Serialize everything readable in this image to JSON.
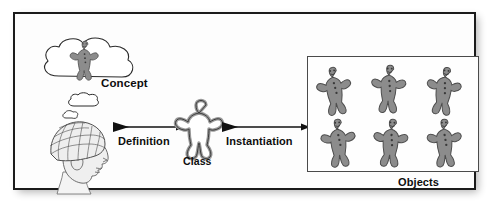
{
  "figure": {
    "frame": {
      "border_color": "#1b1b1b",
      "background": "#fdfdfd"
    }
  },
  "labels": {
    "concept": "Concept",
    "definition": "Definition",
    "class": "Class",
    "instantiation": "Instantiation",
    "objects": "Objects"
  },
  "elements": {
    "thought_cloud": "thought-cloud",
    "concept_figure": "gingerbread-man",
    "head": "human-head-phrenology",
    "class_shape": "cookie-cutter-outline",
    "arrow_definition": "right-arrow",
    "arrow_instantiation": "right-arrow"
  },
  "objects_box": {
    "count": 6,
    "rows": 2,
    "columns": 3,
    "items": [
      {
        "name": "gingerbread-man-1"
      },
      {
        "name": "gingerbread-man-2"
      },
      {
        "name": "gingerbread-man-3"
      },
      {
        "name": "gingerbread-man-4"
      },
      {
        "name": "gingerbread-man-5"
      },
      {
        "name": "gingerbread-man-6"
      }
    ]
  },
  "colors": {
    "cookie_fill": "#8c8c8c",
    "cookie_stroke": "#4d4d4d",
    "outline": "#2b2b2b",
    "text": "#0d0d0d",
    "box_border": "#4a4a4a"
  }
}
